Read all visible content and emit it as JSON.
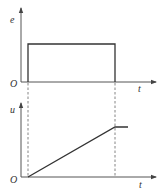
{
  "top_graph": {
    "y_label": "e",
    "x_label": "t",
    "origin_label": "O",
    "signal": "rectangular pulse"
  },
  "bottom_graph": {
    "y_label": "u",
    "x_label": "t",
    "origin_label": "O",
    "signal": "linear ramp then constant"
  },
  "colors": {
    "line": "#333333",
    "axis": "#555555",
    "dash": "#777777"
  }
}
